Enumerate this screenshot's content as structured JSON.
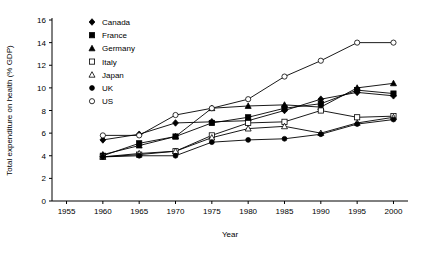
{
  "chart_data": {
    "type": "line",
    "title": "",
    "xlabel": "Year",
    "ylabel": "Total expenditure on health (% GDP)",
    "xlim": [
      1953,
      2002
    ],
    "ylim": [
      0,
      16
    ],
    "xticks": [
      1955,
      1960,
      1965,
      1970,
      1975,
      1980,
      1985,
      1990,
      1995,
      2000
    ],
    "yticks": [
      0,
      2,
      4,
      6,
      8,
      10,
      12,
      14,
      16
    ],
    "grid": false,
    "legend_position": "top-center",
    "x": [
      1960,
      1965,
      1970,
      1975,
      1980,
      1985,
      1990,
      1995,
      2000
    ],
    "series": [
      {
        "name": "Canada",
        "marker": "filled-diamond",
        "values": [
          5.4,
          5.9,
          6.9,
          7.0,
          7.1,
          8.0,
          9.0,
          9.6,
          9.3
        ]
      },
      {
        "name": "France",
        "marker": "filled-square",
        "values": [
          4.0,
          5.1,
          5.7,
          6.9,
          7.4,
          8.2,
          8.6,
          9.8,
          9.5
        ]
      },
      {
        "name": "Germany",
        "marker": "filled-triangle",
        "values": [
          4.1,
          4.9,
          5.7,
          8.2,
          8.4,
          8.5,
          8.3,
          10.0,
          10.4
        ]
      },
      {
        "name": "Italy",
        "marker": "open-square",
        "values": [
          3.9,
          4.1,
          4.4,
          5.8,
          6.9,
          7.0,
          8.0,
          7.4,
          7.5
        ]
      },
      {
        "name": "Japan",
        "marker": "open-triangle",
        "values": [
          3.9,
          4.2,
          4.4,
          5.6,
          6.4,
          6.6,
          6.0,
          6.9,
          7.4
        ]
      },
      {
        "name": "UK",
        "marker": "filled-circle",
        "values": [
          3.9,
          4.0,
          4.0,
          5.2,
          5.4,
          5.5,
          5.9,
          6.8,
          7.2
        ]
      },
      {
        "name": "US",
        "marker": "open-circle",
        "values": [
          5.8,
          5.8,
          7.6,
          8.2,
          9.0,
          11.0,
          12.4,
          14.0,
          14.0
        ]
      }
    ]
  },
  "legend": {
    "items": [
      {
        "label": "Canada"
      },
      {
        "label": "France"
      },
      {
        "label": "Germany"
      },
      {
        "label": "Italy"
      },
      {
        "label": "Japan"
      },
      {
        "label": "UK"
      },
      {
        "label": "US"
      }
    ]
  }
}
